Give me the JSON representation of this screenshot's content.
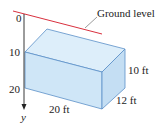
{
  "figure": {
    "ground_label": "Ground level",
    "axis": {
      "variable": "y",
      "ticks": [
        "0",
        "10",
        "20"
      ]
    },
    "box": {
      "length_label": "20 ft",
      "width_label": "12 ft",
      "height_label": "10 ft"
    },
    "colors": {
      "ground_line": "#d9303e",
      "box_fill_front": "#cfe6f7",
      "box_fill_top": "#ddeefa",
      "box_fill_side": "#c4def3",
      "box_edge": "#5b8fc8",
      "axis": "#222222"
    }
  }
}
